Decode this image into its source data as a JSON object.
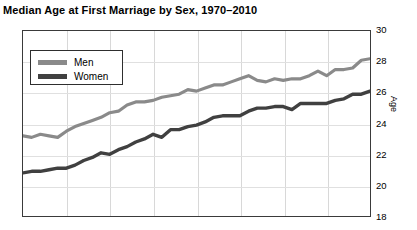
{
  "chart_data": {
    "type": "line",
    "title": "Median Age at First Marriage by Sex, 1970–2010",
    "xlabel": "",
    "ylabel": "Age",
    "ylim": [
      18,
      30
    ],
    "xlim": [
      1970,
      2010
    ],
    "grid": true,
    "legend_position": "top-left",
    "y_ticks": [
      30,
      28,
      26,
      24,
      22,
      20,
      18
    ],
    "x_gridlines": [
      1975,
      1980,
      1985,
      1990,
      1995,
      2000,
      2005
    ],
    "x_tick_labels": [],
    "x": [
      1970,
      1971,
      1972,
      1973,
      1974,
      1975,
      1976,
      1977,
      1978,
      1979,
      1980,
      1981,
      1982,
      1983,
      1984,
      1985,
      1986,
      1987,
      1988,
      1989,
      1990,
      1991,
      1992,
      1993,
      1994,
      1995,
      1996,
      1997,
      1998,
      1999,
      2000,
      2001,
      2002,
      2003,
      2004,
      2005,
      2006,
      2007,
      2008,
      2009,
      2010
    ],
    "series": [
      {
        "name": "Men",
        "color": "#8a8a8a",
        "values": [
          23.2,
          23.1,
          23.3,
          23.2,
          23.1,
          23.5,
          23.8,
          24.0,
          24.2,
          24.4,
          24.7,
          24.8,
          25.2,
          25.4,
          25.4,
          25.5,
          25.7,
          25.8,
          25.9,
          26.2,
          26.1,
          26.3,
          26.5,
          26.5,
          26.7,
          26.9,
          27.1,
          26.8,
          26.7,
          26.9,
          26.8,
          26.9,
          26.9,
          27.1,
          27.4,
          27.1,
          27.5,
          27.5,
          27.6,
          28.1,
          28.2
        ]
      },
      {
        "name": "Women",
        "color": "#404040",
        "values": [
          20.8,
          20.9,
          20.9,
          21.0,
          21.1,
          21.1,
          21.3,
          21.6,
          21.8,
          22.1,
          22.0,
          22.3,
          22.5,
          22.8,
          23.0,
          23.3,
          23.1,
          23.6,
          23.6,
          23.8,
          23.9,
          24.1,
          24.4,
          24.5,
          24.5,
          24.5,
          24.8,
          25.0,
          25.0,
          25.1,
          25.1,
          24.9,
          25.3,
          25.3,
          25.3,
          25.3,
          25.5,
          25.6,
          25.9,
          25.9,
          26.1
        ]
      }
    ]
  },
  "legend": {
    "items": [
      {
        "label": "Men"
      },
      {
        "label": "Women"
      }
    ]
  },
  "axis": {
    "y_label": "Age"
  }
}
